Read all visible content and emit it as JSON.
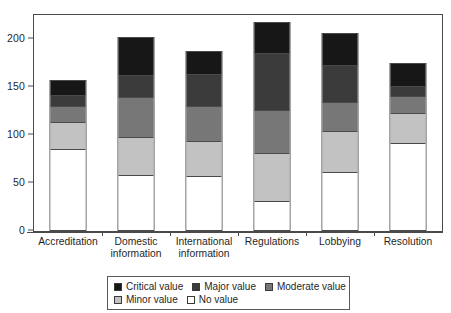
{
  "chart_data": {
    "type": "bar",
    "subtype": "stacked-bar",
    "title": "",
    "xlabel": "",
    "ylabel": "",
    "ylim": [
      0,
      225
    ],
    "yticks": [
      0,
      50,
      100,
      150,
      200
    ],
    "ytick_labels": [
      "0",
      "50",
      "100",
      "150",
      "200"
    ],
    "grid": false,
    "legend_position": "bottom-center",
    "categories": [
      "Accreditation",
      "Domestic information",
      "International information",
      "Regulations",
      "Lobbying",
      "Resolution"
    ],
    "category_label_lines": [
      [
        "Accreditation"
      ],
      [
        "Domestic",
        "information"
      ],
      [
        "International",
        "information"
      ],
      [
        "Regulations"
      ],
      [
        "Lobbying"
      ],
      [
        "Resolution"
      ]
    ],
    "series": [
      {
        "name": "Critical value",
        "key": "critical",
        "color": "#171717",
        "values": [
          15,
          39,
          24,
          32,
          32,
          23
        ]
      },
      {
        "name": "Major value",
        "key": "major",
        "color": "#3b3b3b",
        "values": [
          11,
          23,
          33,
          60,
          39,
          11
        ]
      },
      {
        "name": "Moderate value",
        "key": "moderate",
        "color": "#777777",
        "values": [
          17,
          42,
          37,
          45,
          31,
          18
        ]
      },
      {
        "name": "Minor value",
        "key": "minor",
        "color": "#c2c2c2",
        "values": [
          29,
          40,
          37,
          50,
          43,
          31
        ]
      },
      {
        "name": "No value",
        "key": "no",
        "color": "#ffffff",
        "values": [
          85,
          58,
          57,
          31,
          61,
          92
        ]
      }
    ],
    "stack_order_bottom_to_top": [
      "No value",
      "Minor value",
      "Moderate value",
      "Major value",
      "Critical value"
    ],
    "totals": [
      157,
      202,
      188,
      218,
      207,
      175
    ]
  },
  "legend": {
    "rows": [
      [
        {
          "label": "Critical value",
          "color": "#171717"
        },
        {
          "label": "Major value",
          "color": "#3b3b3b"
        },
        {
          "label": "Moderate value",
          "color": "#777777"
        }
      ],
      [
        {
          "label": "Minor value",
          "color": "#c2c2c2"
        },
        {
          "label": "No value",
          "color": "#ffffff"
        }
      ]
    ]
  }
}
